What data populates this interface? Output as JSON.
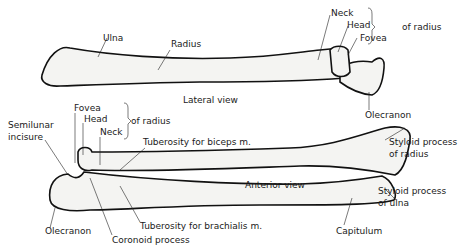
{
  "figure": {
    "lateral_view": {
      "caption": "Lateral view",
      "labels": {
        "ulna": "Ulna",
        "radius": "Radius",
        "neck": "Neck",
        "head": "Head",
        "fovea": "Fovea",
        "bracket": "of radius",
        "olecranon": "Olecranon"
      }
    },
    "anterior_view": {
      "caption": "Anterior view",
      "labels": {
        "fovea": "Fovea",
        "head": "Head",
        "neck": "Neck",
        "bracket": "of radius",
        "semilunar_1": "Semilunar",
        "semilunar_2": "incisure",
        "tuberosity_biceps": "Tuberosity for biceps m.",
        "styloid_radius_1": "Styloid process",
        "styloid_radius_2": "of radius",
        "styloid_ulna_1": "Styloid process",
        "styloid_ulna_2": "of ulna",
        "olecranon": "Olecranon",
        "tuberosity_brachialis": "Tuberosity for brachialis m.",
        "coronoid": "Coronoid process",
        "capitulum": "Capitulum"
      }
    }
  }
}
